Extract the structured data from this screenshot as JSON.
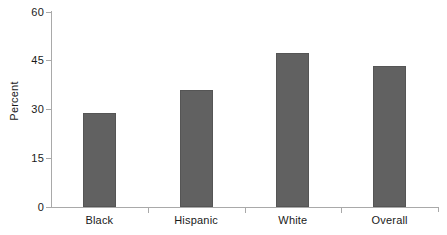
{
  "chart_data": {
    "type": "bar",
    "title": "",
    "subtitle": "",
    "xlabel": "",
    "ylabel": "Percent",
    "categories": [
      "Black",
      "Hispanic",
      "White",
      "Overall"
    ],
    "values": [
      29.0,
      35.8,
      47.3,
      43.3
    ],
    "ylim": [
      0,
      60
    ],
    "yticks": [
      0,
      15,
      30,
      45,
      60
    ],
    "ytick_labels": [
      "0",
      "15",
      "30",
      "45",
      "60"
    ],
    "grid": false,
    "legend": null,
    "legend_position": "none",
    "bar_color": "#616161",
    "bar_edge_color": "#555555",
    "axis_color": "#a9a9a9",
    "text_color": "#1a1a1a",
    "background_color": "#ffffff",
    "annotations": []
  }
}
